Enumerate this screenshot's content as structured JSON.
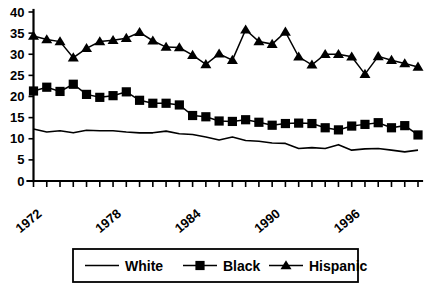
{
  "chart_data": {
    "type": "line",
    "title": "",
    "subtitle": "",
    "xlabel": "",
    "ylabel": "",
    "xlim": [
      1972,
      2001
    ],
    "ylim": [
      0,
      40
    ],
    "grid": false,
    "legend_position": "bottom",
    "x": [
      1972,
      1973,
      1974,
      1975,
      1976,
      1977,
      1978,
      1979,
      1980,
      1981,
      1982,
      1983,
      1984,
      1985,
      1986,
      1987,
      1988,
      1989,
      1990,
      1991,
      1992,
      1993,
      1994,
      1995,
      1996,
      1997,
      1998,
      1999,
      2000,
      2001
    ],
    "xtick_values": [
      1972,
      1978,
      1984,
      1990,
      1996
    ],
    "xtick_labels": [
      "1972",
      "1978",
      "1984",
      "1990",
      "1996"
    ],
    "ytick_values": [
      0,
      5,
      10,
      15,
      20,
      25,
      30,
      35,
      40
    ],
    "ytick_labels": [
      "0",
      "5",
      "10",
      "15",
      "20",
      "25",
      "30",
      "35",
      "40"
    ],
    "series": [
      {
        "name": "White",
        "marker": "none",
        "color": "#000000",
        "values": [
          12.3,
          11.6,
          11.9,
          11.4,
          12.0,
          11.9,
          11.9,
          11.6,
          11.4,
          11.4,
          11.8,
          11.2,
          11.0,
          10.4,
          9.7,
          10.4,
          9.6,
          9.4,
          9.0,
          8.9,
          7.7,
          7.9,
          7.7,
          8.6,
          7.3,
          7.6,
          7.7,
          7.3,
          6.9,
          7.3
        ]
      },
      {
        "name": "Black",
        "marker": "square",
        "color": "#000000",
        "values": [
          21.3,
          22.2,
          21.2,
          22.9,
          20.5,
          19.8,
          20.2,
          21.1,
          19.1,
          18.4,
          18.4,
          18.0,
          15.5,
          15.2,
          14.2,
          14.1,
          14.5,
          13.9,
          13.2,
          13.6,
          13.7,
          13.6,
          12.6,
          12.1,
          13.0,
          13.4,
          13.8,
          12.6,
          13.1,
          10.9
        ]
      },
      {
        "name": "Hispanic",
        "marker": "triangle",
        "color": "#000000",
        "values": [
          34.3,
          33.5,
          33.0,
          29.2,
          31.4,
          33.0,
          33.3,
          33.8,
          35.2,
          33.2,
          31.7,
          31.6,
          29.8,
          27.6,
          30.1,
          28.6,
          35.8,
          33.0,
          32.4,
          35.3,
          29.4,
          27.5,
          30.0,
          30.0,
          29.4,
          25.3,
          29.5,
          28.6,
          27.8,
          27.0
        ]
      }
    ],
    "legend_entries": [
      {
        "label": "White",
        "marker": "none"
      },
      {
        "label": "Black",
        "marker": "square"
      },
      {
        "label": "Hispanic",
        "marker": "triangle"
      }
    ]
  }
}
